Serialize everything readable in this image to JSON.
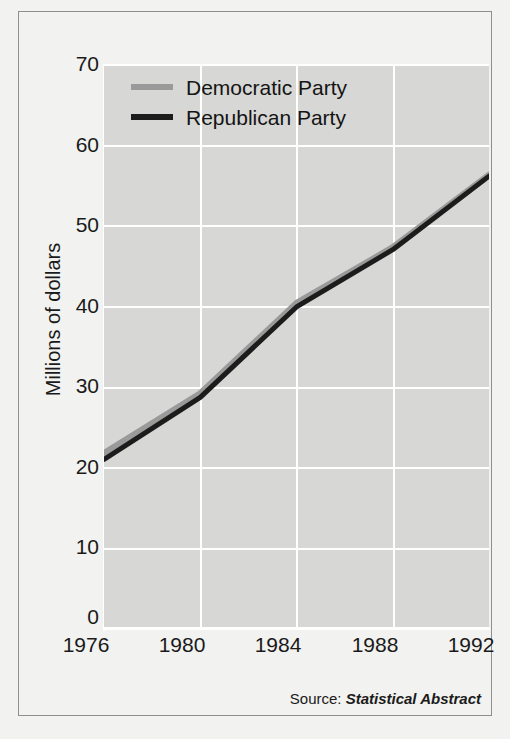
{
  "chart_data": {
    "type": "line",
    "title": "",
    "xlabel": "",
    "ylabel": "Millions of dollars",
    "x": [
      1976,
      1980,
      1984,
      1988,
      1992
    ],
    "xticklabels": [
      "1976",
      "1980",
      "1984",
      "1988",
      "1992"
    ],
    "yticklabels": [
      "0",
      "10",
      "20",
      "30",
      "40",
      "50",
      "60",
      "70"
    ],
    "yticks": [
      0,
      10,
      20,
      30,
      40,
      50,
      60,
      70
    ],
    "xlim": [
      1976,
      1992
    ],
    "ylim": [
      0,
      70
    ],
    "grid": true,
    "legend_position": "upper left",
    "series": [
      {
        "name": "Democratic Party",
        "color": "#9a9a9a",
        "values": [
          21.8,
          29.2,
          40.4,
          47.3,
          56.3
        ]
      },
      {
        "name": "Republican Party",
        "color": "#1c1c1c",
        "values": [
          21.0,
          28.7,
          39.9,
          47.0,
          56.1
        ]
      }
    ]
  },
  "legend": {
    "items": [
      {
        "label": "Democratic Party",
        "swatch_color": "#9a9a9a"
      },
      {
        "label": "Republican Party",
        "swatch_color": "#1c1c1c"
      }
    ]
  },
  "axes": {
    "y_axis_title": "Millions of dollars",
    "y_ticks": [
      "70",
      "60",
      "50",
      "40",
      "30",
      "20",
      "10",
      "0"
    ],
    "x_ticks": [
      "1976",
      "1980",
      "1984",
      "1988",
      "1992"
    ]
  },
  "source": {
    "prefix": "Source:",
    "work": "Statistical Abstract"
  },
  "colors": {
    "figure_background": "#f2f2f0",
    "plot_background": "#d7d7d5",
    "gridline": "#ffffff",
    "frame_border": "#8f8f8f",
    "text": "#1a1a1a"
  }
}
